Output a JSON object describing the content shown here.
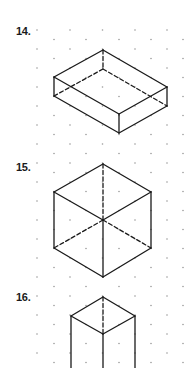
{
  "grid": {
    "dot_color": "#9a9a9a",
    "dot_radius": 0.8,
    "row_start_y": 30,
    "row_step_y": 9.5,
    "row_count": 36,
    "even_row_x": [
      37,
      70,
      102.5,
      135,
      167
    ],
    "odd_row_x": [
      54,
      86,
      119,
      151,
      183
    ]
  },
  "style": {
    "line_color": "#1a1a1a",
    "line_width": 1.3,
    "dash": "4 2.5"
  },
  "problems": [
    {
      "number": "14.",
      "label_pos": [
        16,
        26
      ],
      "solid_edges": [
        [
          [
            103,
            50
          ],
          [
            54,
            77
          ]
        ],
        [
          [
            103,
            50
          ],
          [
            167,
            87
          ]
        ],
        [
          [
            54,
            77
          ],
          [
            119,
            114
          ]
        ],
        [
          [
            167,
            87
          ],
          [
            119,
            114
          ]
        ],
        [
          [
            54,
            77
          ],
          [
            54,
            96
          ]
        ],
        [
          [
            167,
            87
          ],
          [
            167,
            106
          ]
        ],
        [
          [
            119,
            114
          ],
          [
            119,
            133
          ]
        ],
        [
          [
            54,
            96
          ],
          [
            119,
            133
          ]
        ],
        [
          [
            167,
            106
          ],
          [
            119,
            133
          ]
        ]
      ],
      "hidden_edges": [
        [
          [
            103,
            50
          ],
          [
            103,
            69
          ]
        ],
        [
          [
            103,
            69
          ],
          [
            54,
            96
          ]
        ],
        [
          [
            103,
            69
          ],
          [
            167,
            106
          ]
        ]
      ]
    },
    {
      "number": "15.",
      "label_pos": [
        16,
        162
      ],
      "solid_edges": [
        [
          [
            103,
            164
          ],
          [
            54,
            192
          ]
        ],
        [
          [
            103,
            164
          ],
          [
            151,
            192
          ]
        ],
        [
          [
            54,
            192
          ],
          [
            103,
            220
          ]
        ],
        [
          [
            151,
            192
          ],
          [
            103,
            220
          ]
        ],
        [
          [
            54,
            192
          ],
          [
            54,
            248
          ]
        ],
        [
          [
            151,
            192
          ],
          [
            151,
            248
          ]
        ],
        [
          [
            103,
            220
          ],
          [
            103,
            277
          ]
        ],
        [
          [
            54,
            248
          ],
          [
            103,
            277
          ]
        ],
        [
          [
            151,
            248
          ],
          [
            103,
            277
          ]
        ]
      ],
      "hidden_edges": [
        [
          [
            103,
            164
          ],
          [
            103,
            220
          ]
        ],
        [
          [
            103,
            220
          ],
          [
            54,
            248
          ]
        ],
        [
          [
            103,
            220
          ],
          [
            151,
            248
          ]
        ]
      ]
    },
    {
      "number": "16.",
      "label_pos": [
        16,
        292
      ],
      "solid_edges": [
        [
          [
            103,
            297
          ],
          [
            71,
            316
          ]
        ],
        [
          [
            103,
            297
          ],
          [
            135,
            316
          ]
        ],
        [
          [
            71,
            316
          ],
          [
            103,
            334
          ]
        ],
        [
          [
            135,
            316
          ],
          [
            103,
            334
          ]
        ],
        [
          [
            71,
            316
          ],
          [
            71,
            368
          ]
        ],
        [
          [
            135,
            316
          ],
          [
            135,
            368
          ]
        ],
        [
          [
            103,
            334
          ],
          [
            103,
            368
          ]
        ]
      ],
      "hidden_edges": [
        [
          [
            103,
            297
          ],
          [
            103,
            334
          ]
        ]
      ]
    }
  ]
}
